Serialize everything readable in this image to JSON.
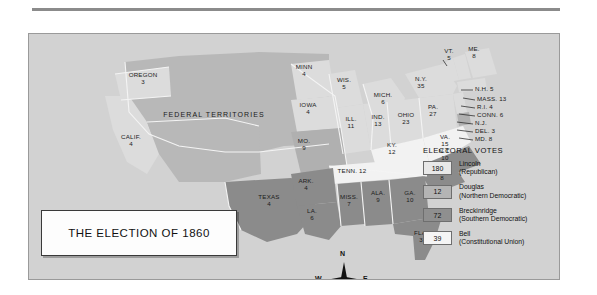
{
  "title_box": {
    "text": "THE ELECTION OF 1860"
  },
  "territories_label": "FEDERAL TERRITORIES",
  "legend": {
    "heading": "ELECTORAL VOTES",
    "entries": [
      {
        "votes": "180",
        "name": "Lincoln",
        "party": "(Republican)",
        "color": "#e8e8e8"
      },
      {
        "votes": "12",
        "name": "Douglas",
        "party": "(Northern Democratic)",
        "color": "#b4b4b4"
      },
      {
        "votes": "72",
        "name": "Breckinridge",
        "party": "(Southern Democratic)",
        "color": "#8f8f8f"
      },
      {
        "votes": "39",
        "name": "Bell",
        "party": "(Constitutional Union)",
        "color": "#f5f5f5"
      }
    ]
  },
  "compass": {
    "n": "N",
    "s": "S",
    "e": "E",
    "w": "W"
  },
  "states": {
    "oregon": {
      "name": "OREGON",
      "votes": "3"
    },
    "calif": {
      "name": "CALIF.",
      "votes": "4"
    },
    "minn": {
      "name": "MINN",
      "votes": "4"
    },
    "wis": {
      "name": "WIS.",
      "votes": "5"
    },
    "iowa": {
      "name": "IOWA",
      "votes": "4"
    },
    "mich": {
      "name": "MICH.",
      "votes": "6"
    },
    "ill": {
      "name": "ILL.",
      "votes": "11"
    },
    "ind": {
      "name": "IND.",
      "votes": "13"
    },
    "ohio": {
      "name": "OHIO",
      "votes": "23"
    },
    "mo": {
      "name": "MO.",
      "votes": "9"
    },
    "ky": {
      "name": "KY.",
      "votes": "12"
    },
    "pa": {
      "name": "PA.",
      "votes": "27"
    },
    "va": {
      "name": "VA.",
      "votes": "15"
    },
    "ny": {
      "name": "N.Y.",
      "votes": "35"
    },
    "vt": {
      "name": "VT.",
      "votes": "5"
    },
    "me": {
      "name": "ME.",
      "votes": "8"
    },
    "ark": {
      "name": "ARK.",
      "votes": "4"
    },
    "texas": {
      "name": "TEXAS",
      "votes": "4"
    },
    "la": {
      "name": "LA.",
      "votes": "6"
    },
    "miss": {
      "name": "MISS.",
      "votes": "7"
    },
    "ala": {
      "name": "ALA.",
      "votes": "9"
    },
    "ga": {
      "name": "GA.",
      "votes": "10"
    },
    "fla": {
      "name": "FLA.",
      "votes": "3"
    },
    "sc": {
      "name": "S.C.",
      "votes": "8"
    },
    "nc": {
      "name": "N.C.",
      "votes": "10"
    },
    "tenn": {
      "name": "TENN. 12"
    }
  },
  "callouts": [
    {
      "key": "nh",
      "text": "N.H. 5"
    },
    {
      "key": "mass",
      "text": "MASS. 13"
    },
    {
      "key": "ri",
      "text": "R.I. 4"
    },
    {
      "key": "conn",
      "text": "CONN. 6"
    },
    {
      "key": "nj",
      "text": "N.J."
    },
    {
      "key": "del",
      "text": "DEL. 3"
    },
    {
      "key": "md",
      "text": "MD. 8"
    }
  ]
}
